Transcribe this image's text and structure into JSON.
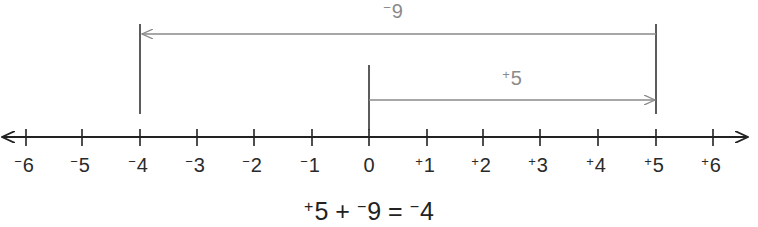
{
  "number_line": {
    "ticks": [
      {
        "value": -6,
        "sign": "−",
        "num": "6",
        "x": 26
      },
      {
        "value": -5,
        "sign": "−",
        "num": "5",
        "x": 82
      },
      {
        "value": -4,
        "sign": "−",
        "num": "4",
        "x": 140
      },
      {
        "value": -3,
        "sign": "−",
        "num": "3",
        "x": 197
      },
      {
        "value": -2,
        "sign": "−",
        "num": "2",
        "x": 254
      },
      {
        "value": -1,
        "sign": "−",
        "num": "1",
        "x": 312
      },
      {
        "value": 0,
        "sign": "",
        "num": "0",
        "x": 369
      },
      {
        "value": 1,
        "sign": "+",
        "num": "1",
        "x": 427
      },
      {
        "value": 2,
        "sign": "+",
        "num": "2",
        "x": 483
      },
      {
        "value": 3,
        "sign": "+",
        "num": "3",
        "x": 540
      },
      {
        "value": 4,
        "sign": "+",
        "num": "4",
        "x": 598
      },
      {
        "value": 5,
        "sign": "+",
        "num": "5",
        "x": 656
      },
      {
        "value": 6,
        "sign": "+",
        "num": "6",
        "x": 713
      }
    ]
  },
  "arrows": {
    "first": {
      "sign": "+",
      "num": "5",
      "from": 0,
      "to": 5
    },
    "second": {
      "sign": "−",
      "num": "9",
      "from": 5,
      "to": -4
    }
  },
  "equation": {
    "a_sign": "+",
    "a_num": "5",
    "op": "+",
    "b_sign": "−",
    "b_num": "9",
    "eq": "=",
    "r_sign": "−",
    "r_num": "4"
  },
  "colors": {
    "axis": "#222222",
    "arrow": "#8a8a8a"
  }
}
